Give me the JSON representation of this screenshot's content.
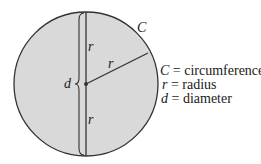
{
  "diagram": {
    "circle_label": "C",
    "radius_label_top": "r",
    "radius_label_diag": "r",
    "radius_label_bottom": "r",
    "diameter_label": "d",
    "colors": {
      "fill": "#d9d9d9",
      "stroke": "#333333"
    }
  },
  "legend": [
    {
      "symbol": "C",
      "text": " = circumference"
    },
    {
      "symbol": "r",
      "text": " = radius"
    },
    {
      "symbol": "d",
      "text": " = diameter"
    }
  ]
}
